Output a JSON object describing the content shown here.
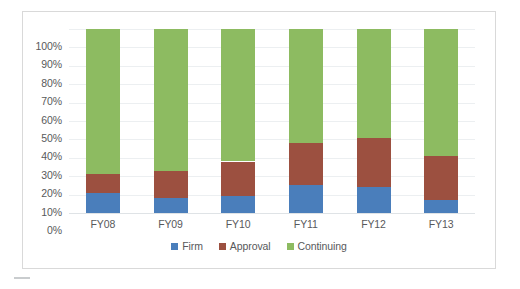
{
  "chart_data": {
    "type": "bar",
    "subtype": "stacked-100-percent",
    "title": "",
    "xlabel": "",
    "ylabel": "",
    "categories": [
      "FY08",
      "FY09",
      "FY10",
      "FY11",
      "FY12",
      "FY13"
    ],
    "series": [
      {
        "name": "Firm",
        "color": "#4a7ebb",
        "values": [
          11,
          8,
          9,
          15,
          14,
          7
        ]
      },
      {
        "name": "Approval",
        "color": "#9c5040",
        "values": [
          10,
          15,
          19,
          23,
          27,
          24
        ]
      },
      {
        "name": "Continuing",
        "color": "#8dbb61",
        "values": [
          79,
          77,
          72,
          62,
          59,
          69
        ]
      }
    ],
    "ylim": [
      0,
      100
    ],
    "y_ticks": [
      "0%",
      "10%",
      "20%",
      "30%",
      "40%",
      "50%",
      "60%",
      "70%",
      "80%",
      "90%",
      "100%"
    ],
    "y_tick_values": [
      0,
      10,
      20,
      30,
      40,
      50,
      60,
      70,
      80,
      90,
      100
    ],
    "grid": true,
    "legend_position": "bottom",
    "legend": [
      "Firm",
      "Approval",
      "Continuing"
    ]
  },
  "colors": {
    "firm": "#4a7ebb",
    "approval": "#9c5040",
    "continuing": "#8dbb61",
    "gridline": "#eceff1",
    "border": "#d9d9d9",
    "text": "#58595b",
    "background": "#ffffff"
  }
}
